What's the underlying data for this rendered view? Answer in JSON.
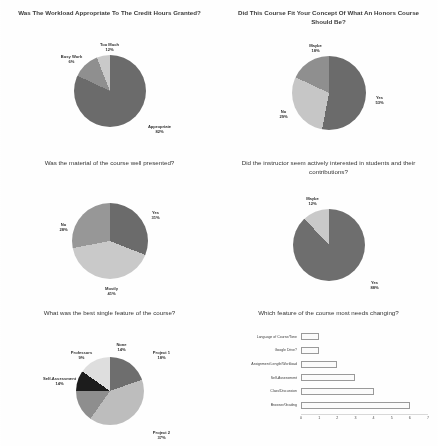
{
  "document": {
    "kind": "survey-results-figure",
    "panel_count": 6
  },
  "chart_data": [
    {
      "id": "workload",
      "type": "pie",
      "title": "Was The Workload Appropriate To The Credit Hours Granted?",
      "categories": [
        "Appropriate",
        "Too Much",
        "Busy Work"
      ],
      "values": [
        82,
        12,
        6
      ],
      "labels": [
        "82%",
        "12%",
        "6%"
      ],
      "colors": [
        "#6b6b6b",
        "#8f8f8f",
        "#c9c9c9"
      ],
      "legend": "none",
      "grid": false
    },
    {
      "id": "honors-concept",
      "type": "pie",
      "title": "Did This Course Fit Your Concept Of What An Honors Course Should Be?",
      "categories": [
        "Yes",
        "No",
        "Maybe"
      ],
      "values": [
        53,
        29,
        18
      ],
      "labels": [
        "53%",
        "29%",
        "18%"
      ],
      "colors": [
        "#6b6b6b",
        "#c6c6c6",
        "#8f8f8f"
      ],
      "legend": "none",
      "grid": false
    },
    {
      "id": "material-presented",
      "type": "pie",
      "title": "Was the material of the course well presented?",
      "categories": [
        "Yes",
        "Mostly",
        "No"
      ],
      "values": [
        31,
        41,
        28
      ],
      "labels": [
        "31%",
        "41%",
        "28%"
      ],
      "colors": [
        "#6b6b6b",
        "#c9c9c9",
        "#979797"
      ],
      "legend": "none",
      "grid": false
    },
    {
      "id": "instructor-interest",
      "type": "pie",
      "title": "Did the instructor seem actively interested in students and their contributions?",
      "categories": [
        "Yes",
        "Maybe"
      ],
      "values": [
        88,
        12
      ],
      "labels": [
        "88%",
        "12%"
      ],
      "colors": [
        "#6e6e6e",
        "#c9c9c9"
      ],
      "legend": "none",
      "grid": false
    },
    {
      "id": "best-feature",
      "type": "pie",
      "title": "What was the best single feature of the course?",
      "categories": [
        "Project 1",
        "Project 2",
        "Self-Assessment",
        "Professors",
        "None"
      ],
      "values": [
        18,
        37,
        14,
        9,
        14
      ],
      "labels": [
        "18%",
        "37%",
        "14%",
        "9%",
        "14%"
      ],
      "colors": [
        "#6e6e6e",
        "#bdbdbd",
        "#8e8e8e",
        "#1c1c1c",
        "#dedede"
      ],
      "legend": "none",
      "grid": false
    },
    {
      "id": "needs-changing",
      "type": "bar",
      "orientation": "horizontal",
      "title": "Which feature of the course most needs changing?",
      "categories": [
        "Language of Course/Tone",
        "Google Drive?",
        "Assignment Length/Workload",
        "Self-Assessment",
        "Class/Discussion",
        "Browser/Grading"
      ],
      "values": [
        1,
        1,
        2,
        3,
        4,
        6
      ],
      "xlabel": "",
      "ylabel": "",
      "xlim": [
        0,
        7
      ],
      "xticks": [
        "0",
        "1",
        "2",
        "3",
        "4",
        "5",
        "6",
        "7"
      ],
      "grid": false
    }
  ]
}
